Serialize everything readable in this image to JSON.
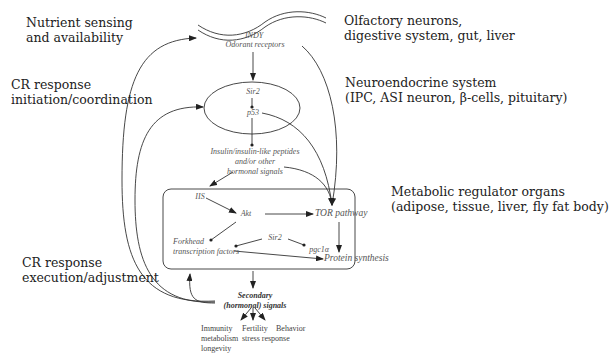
{
  "labels_left": {
    "nutrient": [
      "Nutrient sensing",
      "and availability"
    ],
    "initiation": [
      "CR response",
      "initiation/coordination"
    ],
    "execution": [
      "CR response",
      "execution/adjustment"
    ]
  },
  "labels_right": {
    "olfactory": [
      "Olfactory neurons,",
      "digestive system, gut, liver"
    ],
    "neuroendocrine": [
      "Neuroendocrine system",
      "(IPC, ASI neuron, β-cells, pituitary)"
    ],
    "metabolic": [
      "Metabolic regulator organs",
      "(adipose, tissue, liver, fly fat body)"
    ]
  },
  "nodes": {
    "indy": "INDY",
    "odorant": "Odorant receptors",
    "sir2_top": "Sir2",
    "p53": "p53",
    "insulin": [
      "Insulin/insulin-like peptides",
      "and/or other",
      "hormonal signals"
    ],
    "iis": "IIS",
    "akt": "Akt",
    "tor": "TOR pathway",
    "forkhead": [
      "Forkhead",
      "transcription factors"
    ],
    "sir2_box": "Sir2",
    "pgc1a": "pgc1α",
    "protein": "Protein synthesis",
    "secondary": [
      "Secondary",
      "(hormonal) signals"
    ]
  },
  "outputs": {
    "immunity": [
      "Immunity",
      "metabolism",
      "longevity"
    ],
    "fertility": [
      "Fertility",
      "stress response"
    ],
    "behavior": "Behavior"
  },
  "colors": {
    "line": "#333333",
    "node_text": "#555555",
    "label_text": "#222222"
  }
}
